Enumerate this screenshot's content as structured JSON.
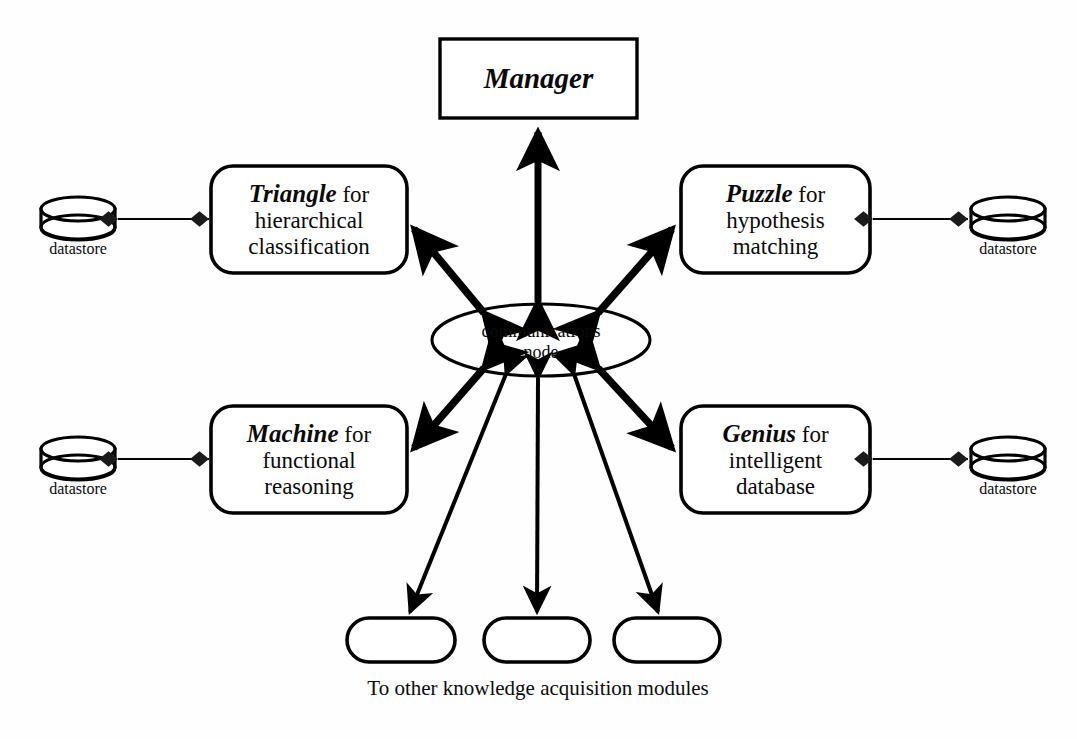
{
  "diagram": {
    "title_text": "Blackboard multi-agent architecture",
    "background_color": "#fefefe",
    "stroke_color": "#000000",
    "fill_color": "#ffffff"
  },
  "manager": {
    "label": "Manager",
    "shape": "rectangle"
  },
  "hub": {
    "line1": "communications",
    "line2": "node",
    "shape": "ellipse"
  },
  "modules": [
    {
      "id": "triangle",
      "name": "Triangle",
      "connector": "for",
      "desc_line1": "hierarchical",
      "desc_line2": "classification",
      "shape": "rounded-rectangle"
    },
    {
      "id": "puzzle",
      "name": "Puzzle",
      "connector": "for",
      "desc_line1": "hypothesis",
      "desc_line2": "matching",
      "shape": "rounded-rectangle"
    },
    {
      "id": "machine",
      "name": "Machine",
      "connector": "for",
      "desc_line1": "functional",
      "desc_line2": "reasoning",
      "shape": "rounded-rectangle"
    },
    {
      "id": "genius",
      "name": "Genius",
      "connector": "for",
      "desc_line1": "intelligent",
      "desc_line2": "database",
      "shape": "rounded-rectangle"
    }
  ],
  "datastores": [
    {
      "id": "datastore-triangle",
      "label": "datastore"
    },
    {
      "id": "datastore-puzzle",
      "label": "datastore"
    },
    {
      "id": "datastore-machine",
      "label": "datastore"
    },
    {
      "id": "datastore-genius",
      "label": "datastore"
    }
  ],
  "other_modules": {
    "caption": "To other knowledge acquisition modules",
    "placeholders": [
      {
        "id": "other-module-1",
        "label": ""
      },
      {
        "id": "other-module-2",
        "label": ""
      },
      {
        "id": "other-module-3",
        "label": ""
      }
    ]
  }
}
